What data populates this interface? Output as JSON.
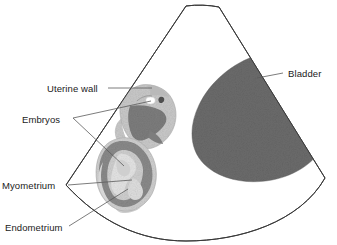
{
  "figure": {
    "modality": "ultrasound-sector-scan",
    "background_color": "#ffffff",
    "outline_color": "#3a3a3a",
    "leader_color": "#5a5a5a",
    "text_color": "#1a1a1a"
  },
  "labels": [
    {
      "id": "uterine-wall",
      "text": "Uterine wall"
    },
    {
      "id": "embryos",
      "text": "Embryos"
    },
    {
      "id": "myometrium",
      "text": "Myometrium"
    },
    {
      "id": "endometrium",
      "text": "Endometrium"
    },
    {
      "id": "bladder",
      "text": "Bladder"
    }
  ],
  "structures": [
    {
      "id": "scan-sector",
      "name": "ultrasound sector field",
      "fill": "#ffffff",
      "stroke": "#3a3a3a"
    },
    {
      "id": "bladder",
      "name": "Bladder",
      "fill": "#6b6b6b"
    },
    {
      "id": "upper-gestational-sac",
      "name": "Upper gestational sac with embryo",
      "wall_fill": "#c9c9c9",
      "cavity_fill": "#7d7d7d",
      "embryo_fill": "#ffffff"
    },
    {
      "id": "lower-gestational-sac",
      "name": "Lower gestational sac with embryo",
      "myometrium_fill": "#8a8a8a",
      "endometrium_fill": "#cfcfcf",
      "embryo_fill": "#e8e8e8"
    }
  ],
  "colors": {
    "bladder_gray": "#6b6b6b",
    "myometrium_gray": "#8a8a8a",
    "endometrium_light": "#cfcfcf",
    "uterine_wall_light": "#c9c9c9",
    "sac_cavity_dark": "#7d7d7d",
    "outline": "#3a3a3a",
    "leader": "#5a5a5a"
  }
}
